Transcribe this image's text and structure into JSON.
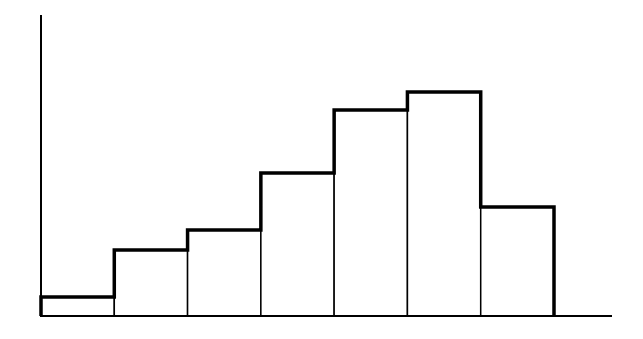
{
  "chart_data": {
    "type": "bar",
    "subtype": "histogram",
    "title": "",
    "xlabel": "",
    "ylabel": "",
    "categories": [
      "bin 1",
      "bin 2",
      "bin 3",
      "bin 4",
      "bin 5",
      "bin 6",
      "bin 7"
    ],
    "values": [
      19,
      66,
      86,
      143,
      206,
      224,
      109
    ],
    "units_note": "relative heights in pixels above baseline (no tick labels shown)",
    "ylim": [
      0,
      301
    ],
    "grid": false,
    "legend": null,
    "style": {
      "outline_color": "#000000",
      "fill_color": "#ffffff",
      "background": "#ffffff"
    }
  }
}
